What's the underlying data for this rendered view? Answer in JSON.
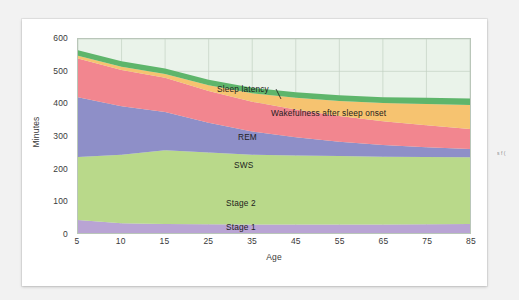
{
  "figure": {
    "caption_fragment": "s f ("
  },
  "chart_data": {
    "type": "area",
    "stacked": true,
    "title": "",
    "xlabel": "Age",
    "ylabel": "Minutes",
    "xlim": [
      5,
      85
    ],
    "ylim": [
      0,
      600
    ],
    "yticks": [
      0,
      100,
      200,
      300,
      400,
      500,
      600
    ],
    "xticks": [
      5,
      10,
      15,
      25,
      35,
      45,
      55,
      65,
      75,
      85
    ],
    "grid": "both",
    "legend_position": "inline-annotations",
    "x": [
      5,
      10,
      15,
      25,
      35,
      45,
      55,
      65,
      75,
      85
    ],
    "series": [
      {
        "name": "Stage 1",
        "color": "#b9a4d4",
        "values": [
          40,
          30,
          28,
          27,
          26,
          26,
          26,
          26,
          27,
          28
        ]
      },
      {
        "name": "Stage 2",
        "color": "#b9d98a",
        "values": [
          195,
          212,
          228,
          222,
          216,
          214,
          212,
          210,
          208,
          206
        ]
      },
      {
        "name": "SWS",
        "color": "#8e8fc8",
        "values": [
          185,
          150,
          118,
          92,
          72,
          56,
          44,
          36,
          30,
          26
        ]
      },
      {
        "name": "REM",
        "color": "#f2868f",
        "values": [
          120,
          112,
          106,
          98,
          92,
          86,
          80,
          74,
          68,
          62
        ]
      },
      {
        "name": "Wakefulness after sleep onset",
        "color": "#f6c370",
        "values": [
          8,
          10,
          12,
          18,
          26,
          36,
          46,
          56,
          66,
          74
        ]
      },
      {
        "name": "Sleep latency",
        "color": "#5eb56b",
        "values": [
          17,
          17,
          17,
          17,
          17,
          17,
          18,
          18,
          19,
          20
        ]
      }
    ],
    "annotations": [
      {
        "label": "Sleep latency",
        "x": 250,
        "y": 72
      },
      {
        "label": "Wakefulness after sleep onset",
        "x": 303,
        "y": 96
      },
      {
        "label": "REM",
        "x": 270,
        "y": 120
      },
      {
        "label": "SWS",
        "x": 266,
        "y": 148
      },
      {
        "label": "Stage 2",
        "x": 258,
        "y": 186
      },
      {
        "label": "Stage 1",
        "x": 258,
        "y": 218
      }
    ]
  }
}
